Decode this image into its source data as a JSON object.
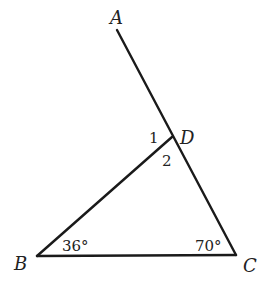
{
  "diagram": {
    "type": "geometry",
    "points": {
      "A": {
        "label": "A",
        "x": 117,
        "y": 30
      },
      "B": {
        "label": "B",
        "x": 37,
        "y": 256
      },
      "C": {
        "label": "C",
        "x": 236,
        "y": 255
      },
      "D": {
        "label": "D",
        "x": 172,
        "y": 137
      }
    },
    "segments": [
      {
        "from": "A",
        "to": "C"
      },
      {
        "from": "B",
        "to": "D"
      },
      {
        "from": "B",
        "to": "C"
      }
    ],
    "angle_labels": {
      "B": "36°",
      "C": "70°",
      "one": "1",
      "two": "2"
    },
    "colors": {
      "line": "#1a1a1a",
      "text": "#222222",
      "background": "#ffffff"
    }
  }
}
